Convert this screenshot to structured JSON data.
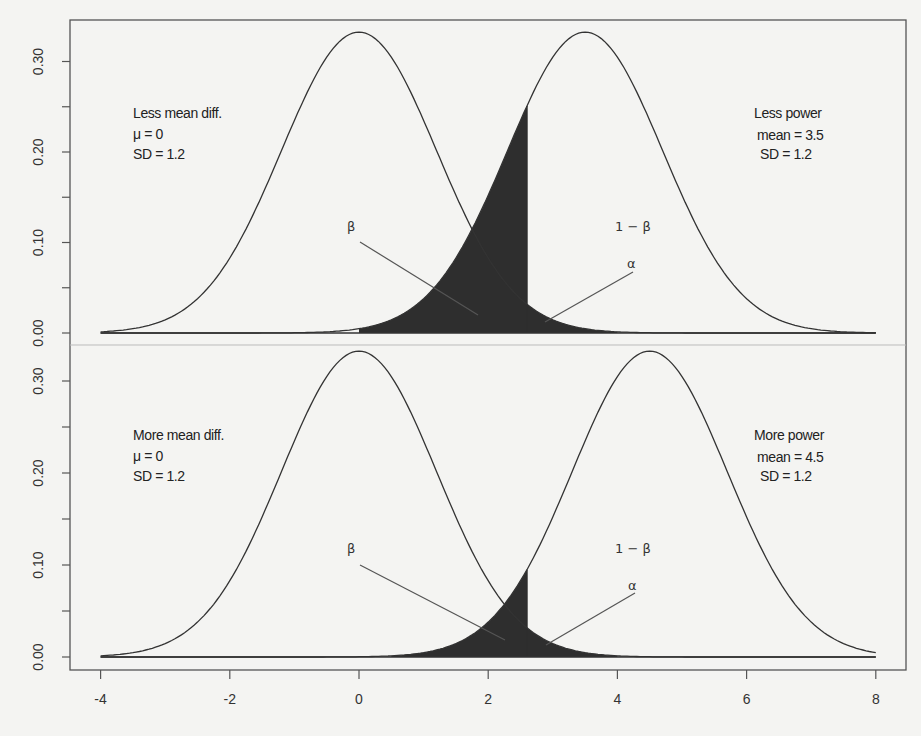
{
  "chart_data": [
    {
      "type": "area",
      "panel": "top",
      "title": "",
      "xlabel": "",
      "ylabel": "",
      "xlim": [
        -4,
        8
      ],
      "ylim": [
        0,
        0.33
      ],
      "x_ticks": [
        -4,
        -2,
        0,
        2,
        4,
        6,
        8
      ],
      "y_ticks": [
        0.0,
        0.05,
        0.1,
        0.15,
        0.2,
        0.25,
        0.3
      ],
      "y_tick_labels": [
        "0.00",
        "",
        "0.10",
        "",
        "0.20",
        "",
        "0.30"
      ],
      "grid": false,
      "critical_value": 2.6,
      "series": [
        {
          "name": "null",
          "mean": 0,
          "sd": 1.2
        },
        {
          "name": "alternative",
          "mean": 3.5,
          "sd": 1.2
        }
      ],
      "shaded_regions": [
        {
          "name": "beta",
          "from": 0,
          "to": 2.6,
          "under": "alternative"
        },
        {
          "name": "alpha",
          "from": 2.6,
          "to": 4,
          "under": "null"
        }
      ],
      "annotations": {
        "left": [
          "Less mean diff.",
          "μ = 0",
          "SD = 1.2"
        ],
        "right": [
          "Less power",
          "mean = 3.5",
          "SD = 1.2"
        ],
        "beta": "β",
        "power": "1 − β",
        "alpha": "α"
      }
    },
    {
      "type": "area",
      "panel": "bottom",
      "title": "",
      "xlabel": "",
      "ylabel": "",
      "xlim": [
        -4,
        8
      ],
      "ylim": [
        0,
        0.33
      ],
      "x_ticks": [
        -4,
        -2,
        0,
        2,
        4,
        6,
        8
      ],
      "x_tick_labels": [
        "-4",
        "-2",
        "0",
        "2",
        "4",
        "6",
        "8"
      ],
      "y_ticks": [
        0.0,
        0.05,
        0.1,
        0.15,
        0.2,
        0.25,
        0.3
      ],
      "y_tick_labels": [
        "0.00",
        "",
        "0.10",
        "",
        "0.20",
        "",
        "0.30"
      ],
      "grid": false,
      "critical_value": 2.6,
      "series": [
        {
          "name": "null",
          "mean": 0,
          "sd": 1.2
        },
        {
          "name": "alternative",
          "mean": 4.5,
          "sd": 1.2
        }
      ],
      "shaded_regions": [
        {
          "name": "beta",
          "from": 0.5,
          "to": 2.6,
          "under": "alternative"
        },
        {
          "name": "alpha",
          "from": 2.6,
          "to": 4,
          "under": "null"
        }
      ],
      "annotations": {
        "left": [
          "More mean diff.",
          "μ = 0",
          "SD = 1.2"
        ],
        "right": [
          "More power",
          "mean = 4.5",
          "SD = 1.2"
        ],
        "beta": "β",
        "power": "1 − β",
        "alpha": "α"
      }
    }
  ],
  "colors": {
    "background": "#f4f4f2",
    "fill": "#2e2e2e",
    "curve": "#333333",
    "axis": "#555555"
  }
}
